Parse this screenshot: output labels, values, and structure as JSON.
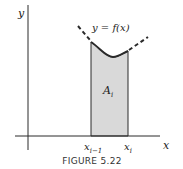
{
  "figure": {
    "caption": "FIGURE 5.22",
    "axis_labels": {
      "x": "x",
      "y": "y"
    },
    "curve_label": "y = f(x)",
    "region_label": "A",
    "region_label_sub": "i",
    "tick_labels": [
      {
        "main": "x",
        "sub": "i−1"
      },
      {
        "main": "x",
        "sub": "i"
      }
    ],
    "colors": {
      "stroke": "#2a2a2a",
      "fill": "#d9d9d9"
    }
  }
}
